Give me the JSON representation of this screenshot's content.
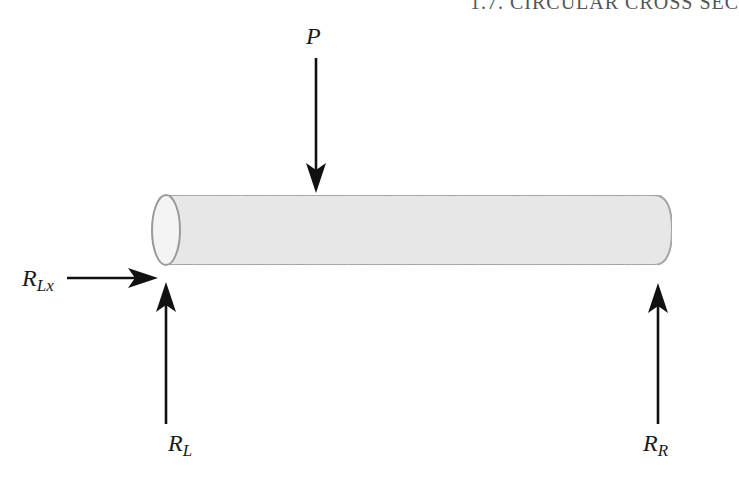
{
  "header": {
    "running_title": "1.7. CIRCULAR CROSS SEC"
  },
  "figure": {
    "colors": {
      "bar_fill": "#e6e6e6",
      "bar_outline": "#9a9a9a",
      "end_face_fill": "#f4f4f4",
      "arrow": "#111111",
      "label": "#1a1a1a"
    },
    "labels": {
      "P": {
        "main": "P",
        "sub": ""
      },
      "RLx": {
        "main": "R",
        "sub": "Lx"
      },
      "RL": {
        "main": "R",
        "sub": "L"
      },
      "RR": {
        "main": "R",
        "sub": "R"
      }
    },
    "elements": [
      {
        "id": "bar",
        "type": "circular-cross-section-beam"
      },
      {
        "id": "P",
        "type": "force-arrow",
        "direction": "down",
        "applied_at": "top surface of beam"
      },
      {
        "id": "RLx",
        "type": "reaction-arrow",
        "direction": "right",
        "applied_at": "left end"
      },
      {
        "id": "RL",
        "type": "reaction-arrow",
        "direction": "up",
        "applied_at": "left end"
      },
      {
        "id": "RR",
        "type": "reaction-arrow",
        "direction": "up",
        "applied_at": "right end"
      }
    ]
  }
}
